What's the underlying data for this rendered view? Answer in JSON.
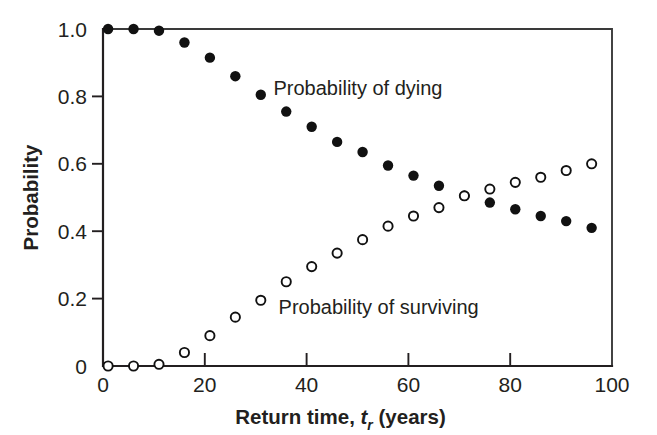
{
  "chart_data": {
    "type": "scatter",
    "title": "",
    "xlabel": "Return time, t_r (years)",
    "xlabel_parts": {
      "lead": "Return time, ",
      "symbol": "t",
      "subscript": "r",
      "trail": " (years)"
    },
    "ylabel": "Probability",
    "xlim": [
      0,
      100
    ],
    "ylim": [
      0,
      1.0
    ],
    "grid": false,
    "legend_position": "inline-annotations",
    "xticks": [
      0,
      20,
      40,
      60,
      80,
      100
    ],
    "xtick_labels": [
      "0",
      "20",
      "40",
      "60",
      "80",
      "100"
    ],
    "yticks": [
      0,
      0.2,
      0.4,
      0.6,
      0.8,
      1.0
    ],
    "ytick_labels": [
      "0",
      "0.2",
      "0.4",
      "0.6",
      "0.8",
      "1.0"
    ],
    "x": [
      1,
      6,
      11,
      16,
      21,
      26,
      31,
      36,
      41,
      46,
      51,
      56,
      61,
      66,
      71,
      76,
      81,
      86,
      91,
      96
    ],
    "series": [
      {
        "name": "Probability of dying",
        "marker": "filled-circle",
        "color": "#111111",
        "values": [
          1.0,
          1.0,
          0.995,
          0.96,
          0.915,
          0.86,
          0.805,
          0.755,
          0.71,
          0.665,
          0.635,
          0.595,
          0.565,
          0.535,
          0.505,
          0.485,
          0.465,
          0.445,
          0.43,
          0.41
        ]
      },
      {
        "name": "Probability of surviving",
        "marker": "open-circle",
        "color": "#111111",
        "values": [
          0.0,
          0.0,
          0.005,
          0.04,
          0.09,
          0.145,
          0.195,
          0.25,
          0.295,
          0.335,
          0.375,
          0.415,
          0.445,
          0.47,
          0.505,
          0.525,
          0.545,
          0.56,
          0.58,
          0.6
        ]
      }
    ],
    "annotations": [
      {
        "text": "Probability of dying",
        "x": 33.5,
        "y": 0.825,
        "anchor": "start",
        "series": "Probability of dying"
      },
      {
        "text": "Probability of surviving",
        "x": 34.5,
        "y": 0.175,
        "anchor": "start",
        "series": "Probability of surviving"
      }
    ]
  }
}
